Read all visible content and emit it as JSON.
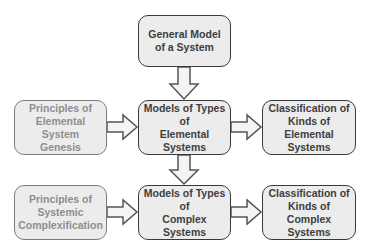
{
  "diagram": {
    "type": "flowchart",
    "nodes": {
      "general_model": {
        "label": "General Model\nof a System",
        "style": "primary"
      },
      "principles_elemental": {
        "label": "Principles of\nElemental System\nGenesis",
        "style": "muted"
      },
      "models_elemental": {
        "label": "Models of Types of\nElemental Systems",
        "style": "primary"
      },
      "classification_elemental": {
        "label": "Classification of\nKinds of\nElemental Systems",
        "style": "primary"
      },
      "principles_complex": {
        "label": "Principles of\nSystemic\nComplexification",
        "style": "muted"
      },
      "models_complex": {
        "label": "Models of Types of\nComplex Systems",
        "style": "primary"
      },
      "classification_complex": {
        "label": "Classification of\nKinds of\nComplex Systems",
        "style": "primary"
      }
    },
    "edges": [
      {
        "from": "general_model",
        "to": "models_elemental",
        "direction": "down"
      },
      {
        "from": "principles_elemental",
        "to": "models_elemental",
        "direction": "right"
      },
      {
        "from": "models_elemental",
        "to": "classification_elemental",
        "direction": "right"
      },
      {
        "from": "models_elemental",
        "to": "models_complex",
        "direction": "down"
      },
      {
        "from": "principles_complex",
        "to": "models_complex",
        "direction": "right"
      },
      {
        "from": "models_complex",
        "to": "classification_complex",
        "direction": "right"
      }
    ],
    "colors": {
      "box_fill": "#ececec",
      "primary_border": "#3a3a3a",
      "primary_text": "#3e3e3e",
      "muted_border": "#7d7d7d",
      "muted_text": "#8e8e8e",
      "arrow_fill": "#f4f4f4",
      "arrow_stroke": "#555555"
    }
  }
}
